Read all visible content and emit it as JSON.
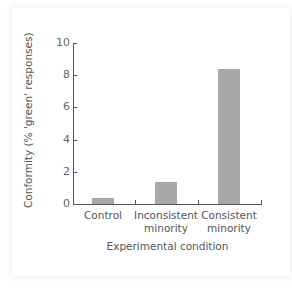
{
  "chart_data": {
    "type": "bar",
    "title": "",
    "categories": [
      "Control",
      "Inconsistent minority",
      "Consistent minority"
    ],
    "category_lines": [
      [
        "Control"
      ],
      [
        "Inconsistent",
        "minority"
      ],
      [
        "Consistent",
        "minority"
      ]
    ],
    "values": [
      0.35,
      1.35,
      8.4
    ],
    "xlabel": "Experimental condition",
    "ylabel": "Conformity (% 'green' responses)",
    "ylim": [
      0,
      10
    ],
    "yticks": [
      "0",
      "2",
      "4",
      "6",
      "8",
      "10"
    ],
    "grid": false,
    "bar_color": "#a8a8a8",
    "axis_color": "#555555"
  }
}
